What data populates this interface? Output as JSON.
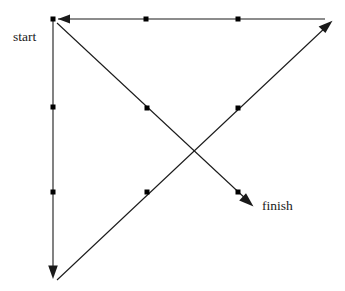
{
  "diagram": {
    "background_color": "#ffffff",
    "stroke_color": "#1a1a1a",
    "marker_color": "#000000",
    "labels": [
      {
        "id": "start",
        "text": "start",
        "x": 13,
        "y": 30
      },
      {
        "id": "finish",
        "text": "finish",
        "x": 262,
        "y": 199
      }
    ],
    "nodes": [
      {
        "id": "n-start",
        "x": 53,
        "y": 19
      },
      {
        "id": "n-top-mid",
        "x": 146,
        "y": 19
      },
      {
        "id": "n-top-right",
        "x": 238,
        "y": 19
      },
      {
        "id": "n-left-upper",
        "x": 53,
        "y": 107
      },
      {
        "id": "n-left-lower",
        "x": 53,
        "y": 192
      },
      {
        "id": "n-desc-upper",
        "x": 147,
        "y": 108
      },
      {
        "id": "n-desc-lower",
        "x": 238,
        "y": 192
      },
      {
        "id": "n-asc-upper",
        "x": 238,
        "y": 108
      },
      {
        "id": "n-asc-lower",
        "x": 147,
        "y": 192
      }
    ],
    "edges": [
      {
        "id": "edge-top-horizontal",
        "from": {
          "x": 325,
          "y": 19
        },
        "to": {
          "x": 58,
          "y": 19
        },
        "arrow": "end",
        "direction": "leftward"
      },
      {
        "id": "edge-left-vertical",
        "from": {
          "x": 53,
          "y": 21
        },
        "to": {
          "x": 53,
          "y": 277
        },
        "arrow": "end",
        "direction": "downward"
      },
      {
        "id": "edge-descending-diagonal",
        "from": {
          "x": 57,
          "y": 23
        },
        "to": {
          "x": 252,
          "y": 205
        },
        "arrow": "end",
        "direction": "down-right"
      },
      {
        "id": "edge-ascending-diagonal",
        "from": {
          "x": 57,
          "y": 280
        },
        "to": {
          "x": 331,
          "y": 22
        },
        "arrow": "end",
        "direction": "up-right"
      }
    ],
    "arrowheads": [
      {
        "id": "arrowhead-left",
        "points": "58,19 70,14.5 70,23.5",
        "for": "edge-top-horizontal"
      },
      {
        "id": "arrowhead-down",
        "points": "53,278 48.2,265.5 57.8,265.5",
        "for": "edge-left-vertical"
      },
      {
        "id": "arrowhead-down-right",
        "points": "253,206 240.8,198.5 245.5,193.0",
        "for": "edge-descending-diagonal"
      },
      {
        "id": "arrowhead-up-right",
        "points": "332,21 319.5,25.5 325.0,31.0",
        "for": "edge-ascending-diagonal"
      }
    ],
    "marker_size": 5
  }
}
